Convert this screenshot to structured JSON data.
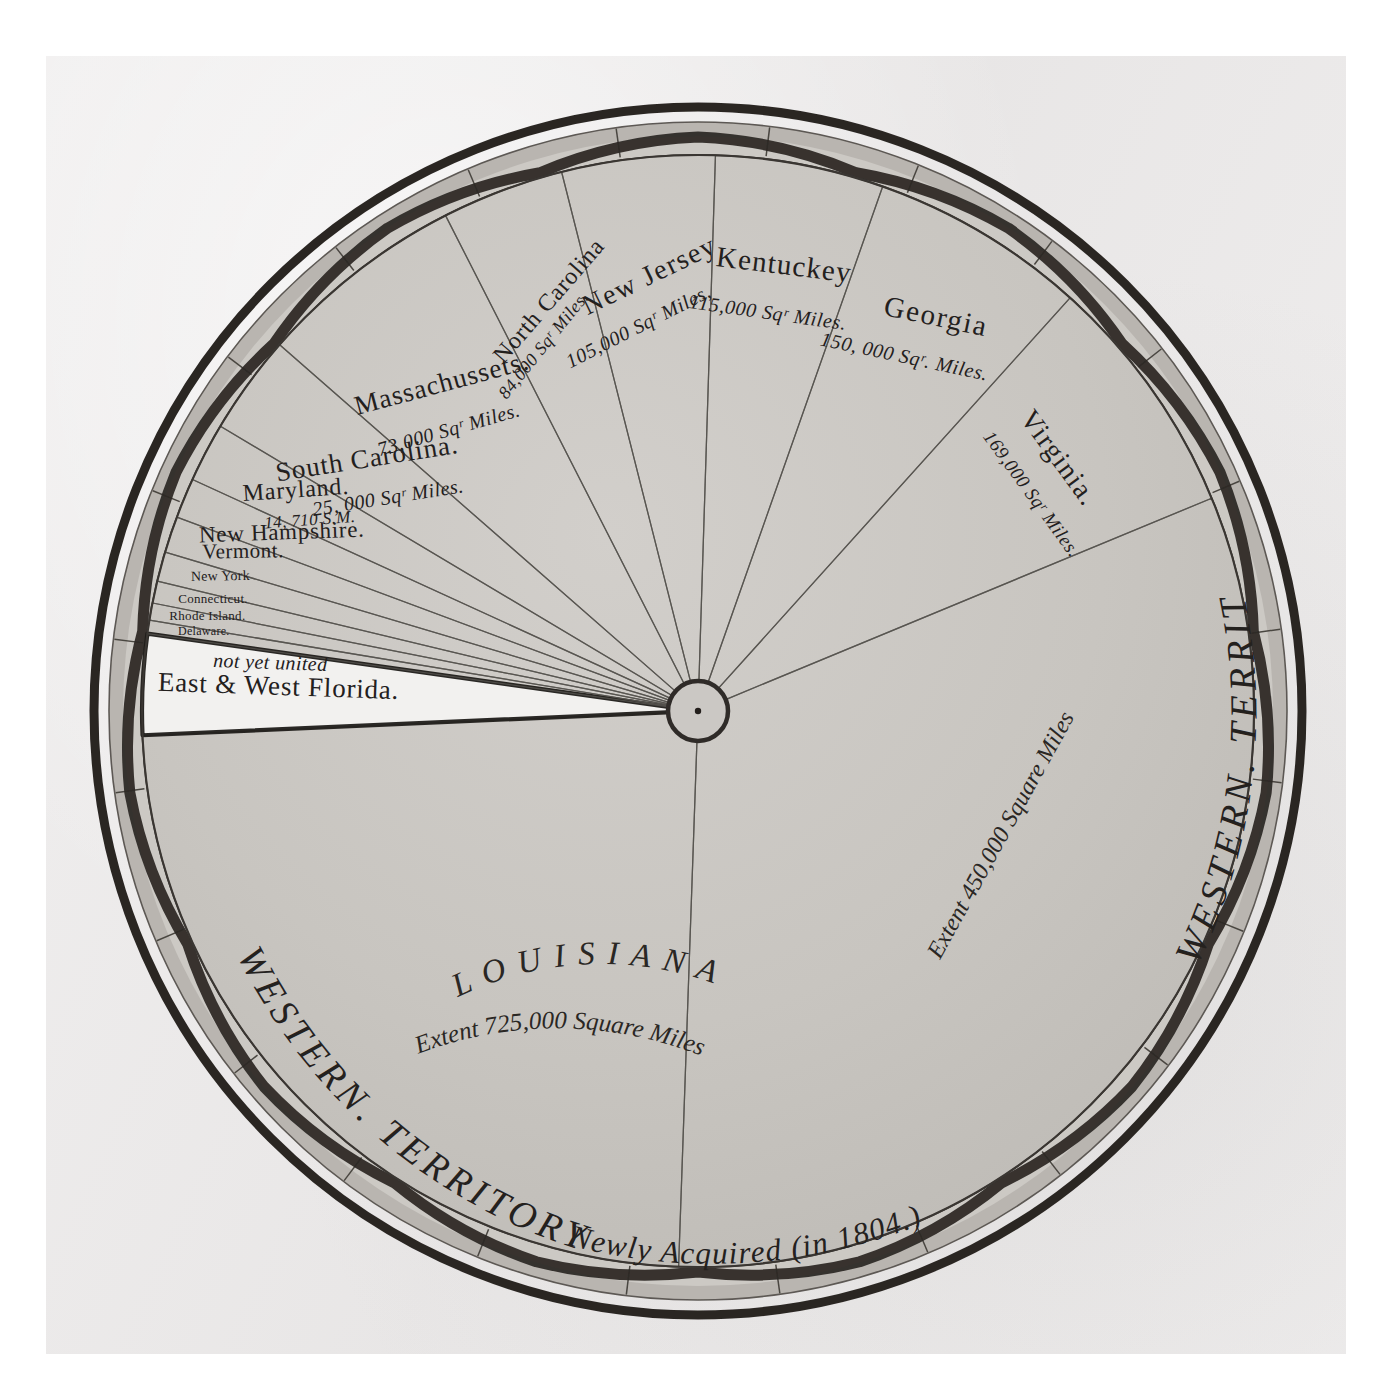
{
  "figure": {
    "kind": "playfair-circle-chart",
    "center": {
      "x": 698,
      "y": 711
    },
    "outer_radius": 604,
    "hub_radius": 30,
    "colors": {
      "paper": "#eceaea",
      "wedge_fill": "#c9c6c2",
      "wedge_line": "#55524e",
      "ring_dark": "#2b2724",
      "ring_band": "#b4b0ab",
      "ink": "#23201d",
      "florida_fill": "#f2f1ef"
    }
  },
  "ring": {
    "label_right": "WESTERN. TERRITORY",
    "label_left": "WESTERN. TERRITORY",
    "label_bottom": "Newly Acquired (in 1804.)"
  },
  "chart_data": {
    "type": "pie",
    "title": "",
    "unit": "square miles",
    "legend": "none",
    "note": "Playfair-style circle diagram of the extent of United States territories, 1805.",
    "categories": [
      "Louisiana",
      "Western Territory",
      "Virginia",
      "Georgia",
      "Kentuckey",
      "New Jersey",
      "North Carolina",
      "Massachussets",
      "South Carolina",
      "Maryland",
      "New Hampshire",
      "Vermont",
      "New York",
      "Connecticut",
      "Rhode Island",
      "Delaware",
      "East & West Florida"
    ],
    "values": [
      725000,
      450000,
      169000,
      150000,
      115000,
      105000,
      84000,
      73000,
      25000,
      14710,
      9500,
      9000,
      7500,
      5000,
      3000,
      2200,
      52000
    ],
    "slices": [
      {
        "name": "Louisiana",
        "label": "L O U I S I A N A",
        "sub1": "Extent 725,000",
        "sub2": "Square Miles",
        "value": 725000,
        "value_text": "725,000",
        "fill": "wedge"
      },
      {
        "name": "Western Territory",
        "label": "",
        "sub1": "Extent 450,000 Square Miles",
        "sub2": "",
        "value": 450000,
        "value_text": "450,000",
        "fill": "wedge"
      },
      {
        "name": "Virginia",
        "label": "Virginia.",
        "sub1": "169,000 Sqʳ Miles.",
        "sub2": "",
        "value": 169000,
        "value_text": "169,000",
        "fill": "wedge"
      },
      {
        "name": "Georgia",
        "label": "Georgia",
        "sub1": "150, 000 Sqʳ. Miles.",
        "sub2": "",
        "value": 150000,
        "value_text": "150,000",
        "fill": "wedge"
      },
      {
        "name": "Kentuckey",
        "label": "Kentuckey",
        "sub1": "115,000 Sqʳ Miles.",
        "sub2": "",
        "value": 115000,
        "value_text": "115,000",
        "fill": "wedge"
      },
      {
        "name": "New Jersey",
        "label": "New Jersey",
        "sub1": "105,000 Sqʳ Miles,",
        "sub2": "",
        "value": 105000,
        "value_text": "105,000",
        "fill": "wedge"
      },
      {
        "name": "North Carolina",
        "label": "North Carolina",
        "sub1": "84,000 Sqʳ Miles.",
        "sub2": "",
        "value": 84000,
        "value_text": "84,000",
        "fill": "wedge"
      },
      {
        "name": "Massachussets",
        "label": "Massachussets.",
        "sub1": "73,000 Sqʳ Miles.",
        "sub2": "",
        "value": 73000,
        "value_text": "73,000",
        "fill": "wedge"
      },
      {
        "name": "South Carolina",
        "label": "South Carolina.",
        "sub1": "25, 000 Sqʳ Miles.",
        "sub2": "",
        "value": 25000,
        "value_text": "25,000",
        "fill": "wedge"
      },
      {
        "name": "Maryland",
        "label": "Maryland.",
        "sub1": "14, 710 S.M.",
        "sub2": "",
        "value": 14710,
        "value_text": "14,710",
        "fill": "wedge"
      },
      {
        "name": "New Hampshire",
        "label": "New Hampshire.",
        "sub1": "",
        "sub2": "",
        "value": 9500,
        "value_text": "",
        "fill": "wedge"
      },
      {
        "name": "Vermont",
        "label": "Vermont.",
        "sub1": "",
        "sub2": "",
        "value": 9000,
        "value_text": "",
        "fill": "wedge"
      },
      {
        "name": "New York",
        "label": "New York",
        "sub1": "",
        "sub2": "",
        "value": 7500,
        "value_text": "",
        "fill": "wedge"
      },
      {
        "name": "Connecticut",
        "label": "Connecticut.",
        "sub1": "",
        "sub2": "",
        "value": 5000,
        "value_text": "",
        "fill": "wedge"
      },
      {
        "name": "Rhode Island",
        "label": "Rhode Island.",
        "sub1": "",
        "sub2": "",
        "value": 3000,
        "value_text": "",
        "fill": "wedge"
      },
      {
        "name": "Delaware",
        "label": "Delaware.",
        "sub1": "",
        "sub2": "",
        "value": 2200,
        "value_text": "",
        "fill": "wedge"
      },
      {
        "name": "East & West Florida",
        "label": "East & West Florida.",
        "sub1": "not yet united",
        "sub2": "",
        "value": 52000,
        "value_text": "",
        "fill": "white"
      }
    ]
  },
  "labels": {
    "kentuckey_name": "Kentuckey",
    "kentuckey_area": "115,000 Sqʳ Miles.",
    "georgia_name": "Georgia",
    "georgia_area": "150, 000 Sqʳ. Miles.",
    "new_jersey_name": "New Jersey",
    "new_jersey_area": "105,000 Sqʳ Miles,",
    "north_carolina_name": "North Carolina",
    "north_carolina_area": "84,000 Sqʳ Miles.",
    "virginia_name": "Virginia.",
    "virginia_area": "169,000 Sqʳ Miles.",
    "massachussets_name": "Massachussets.",
    "massachussets_area": "73,000 Sqʳ Miles.",
    "south_carolina_name": "South Carolina.",
    "south_carolina_area": "25, 000 Sqʳ Miles.",
    "maryland_name": "Maryland.",
    "maryland_area": "14, 710 S.M.",
    "new_hampshire_name": "New Hampshire.",
    "vermont_name": "Vermont.",
    "new_york_name": "New York",
    "connecticut_name": "Connecticut.",
    "rhode_island_name": "Rhode Island.",
    "delaware_name": "Delaware.",
    "florida_name": "East & West Florida.",
    "florida_note": "not yet united",
    "louisiana_name": "L O U I S I A N A",
    "louisiana_extent1": "Extent 725,000",
    "louisiana_extent2": "Square Miles",
    "western_extent": "Extent 450,000 Square Miles",
    "western_right": "WESTERN. TERRITORY",
    "western_left": "WESTERN. TERRITORY",
    "newly_acquired": "Newly Acquired (in 1804.)"
  }
}
